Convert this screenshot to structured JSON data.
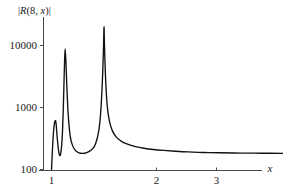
{
  "chart_data": {
    "type": "line",
    "title": "|R(8, x)|",
    "title_parts": {
      "bar_left": "|",
      "r": "R",
      "paren_open": "(",
      "n": "8",
      "comma": ", ",
      "x": "x",
      "paren_close": ")",
      "bar_right": "|"
    },
    "xlabel": "x",
    "ylabel": "",
    "yscale": "log",
    "xscale": "linear",
    "grid": false,
    "legend": null,
    "xlim": [
      0.93,
      3.55
    ],
    "ylim": [
      100,
      26000
    ],
    "xticks": [
      1,
      2,
      3
    ],
    "xtick_labels": [
      "1",
      "2",
      "3"
    ],
    "yticks": [
      100,
      1000,
      10000
    ],
    "ytick_labels": [
      "100",
      "1000",
      "10000"
    ],
    "series": [
      {
        "name": "|R(8, x)|",
        "color": "#111111",
        "points_x": [
          1.0,
          1.005,
          1.012,
          1.02,
          1.028,
          1.035,
          1.04,
          1.045,
          1.05,
          1.058,
          1.066,
          1.074,
          1.082,
          1.09,
          1.098,
          1.105,
          1.112,
          1.118,
          1.124,
          1.13,
          1.138,
          1.146,
          1.155,
          1.165,
          1.18,
          1.2,
          1.225,
          1.25,
          1.275,
          1.3,
          1.33,
          1.36,
          1.39,
          1.42,
          1.45,
          1.47,
          1.485,
          1.495,
          1.5,
          1.505,
          1.515,
          1.53,
          1.55,
          1.58,
          1.62,
          1.67,
          1.73,
          1.8,
          1.88,
          1.97,
          2.07,
          2.18,
          2.3,
          2.45,
          2.6,
          2.8,
          3.0,
          3.2,
          3.4,
          3.52
        ],
        "points_y": [
          100,
          150,
          260,
          420,
          560,
          610,
          600,
          520,
          400,
          280,
          210,
          175,
          168,
          190,
          260,
          420,
          900,
          2200,
          5200,
          8900,
          5200,
          2200,
          1000,
          560,
          330,
          245,
          205,
          190,
          183,
          182,
          186,
          196,
          215,
          260,
          420,
          900,
          2800,
          9000,
          20000,
          9500,
          3000,
          1100,
          620,
          420,
          330,
          282,
          255,
          234,
          220,
          210,
          203,
          197,
          192,
          188,
          186,
          184,
          183,
          182,
          182,
          182
        ]
      }
    ],
    "annotations": [
      {
        "label": "peak-1",
        "x": 1.036,
        "y": 610
      },
      {
        "label": "peak-2",
        "x": 1.13,
        "y": 8900
      },
      {
        "label": "peak-3",
        "x": 1.5,
        "y": 20000
      },
      {
        "label": "asymptote",
        "x": 3.52,
        "y": 182
      }
    ]
  }
}
